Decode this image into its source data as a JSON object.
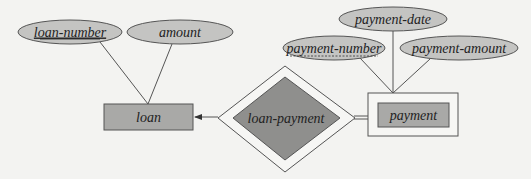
{
  "diagram": {
    "type": "E-R diagram",
    "colors": {
      "background": "#f3f3f1",
      "attribute_fill": "#c4c4c2",
      "entity_fill": "#a9a9a7",
      "relationship_fill": "#8f8f8d",
      "stroke": "#555555",
      "text": "#222222"
    },
    "entities": [
      {
        "id": "loan",
        "label": "loan",
        "weak": false
      },
      {
        "id": "payment",
        "label": "payment",
        "weak": true
      }
    ],
    "relationships": [
      {
        "id": "loan-payment",
        "label": "loan-payment",
        "identifying": true
      }
    ],
    "attributes": [
      {
        "id": "loan-number",
        "label": "loan-number",
        "entity": "loan",
        "key": "primary"
      },
      {
        "id": "amount",
        "label": "amount",
        "entity": "loan",
        "key": "none"
      },
      {
        "id": "payment-date",
        "label": "payment-date",
        "entity": "payment",
        "key": "none"
      },
      {
        "id": "payment-number",
        "label": "payment-number",
        "entity": "payment",
        "key": "discriminator"
      },
      {
        "id": "payment-amount",
        "label": "payment-amount",
        "entity": "payment",
        "key": "none"
      }
    ],
    "connections": [
      {
        "from": "loan-payment",
        "to": "loan",
        "style": "single-arrow"
      },
      {
        "from": "loan-payment",
        "to": "payment",
        "style": "double-line"
      }
    ]
  },
  "labels": {
    "loan_number": "loan-number",
    "amount": "amount",
    "loan": "loan",
    "loan_payment": "loan-payment",
    "payment": "payment",
    "payment_date": "payment-date",
    "payment_number": "payment-number",
    "payment_amount": "payment-amount"
  }
}
